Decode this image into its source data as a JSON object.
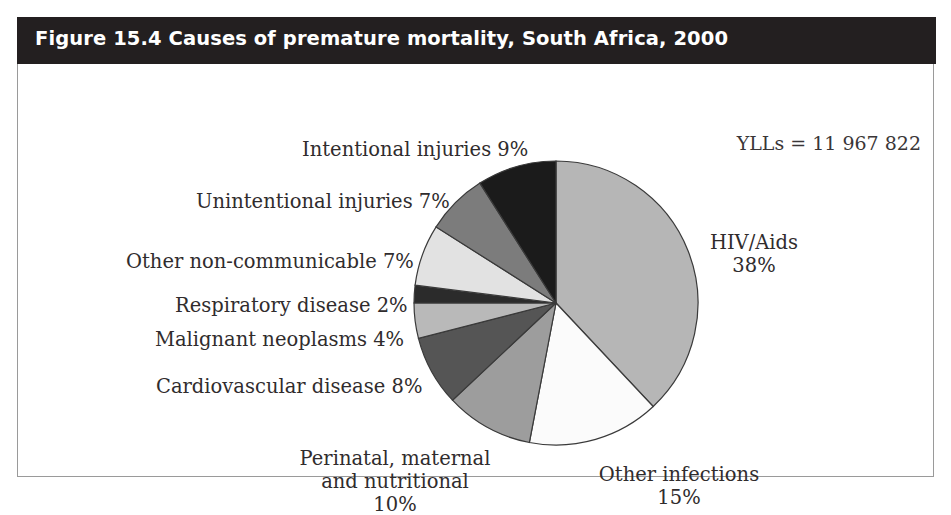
{
  "figure": {
    "title": "Figure 15.4 Causes of premature mortality, South Africa, 2000",
    "yll_total": "YLLs = 11 967 822"
  },
  "labels": {
    "intentional": "Intentional injuries 9%",
    "unintentional": "Unintentional injuries 7%",
    "other_noncommunicable": "Other non-communicable 7%",
    "respiratory": "Respiratory disease 2%",
    "malignant": "Malignant neoplasms 4%",
    "cardiovascular": "Cardiovascular disease 8%",
    "perinatal_line1": "Perinatal, maternal",
    "perinatal_line2": "and nutritional",
    "perinatal_line3": "10%",
    "other_infections_line1": "Other infections",
    "other_infections_line2": "15%",
    "hiv_line1": "HIV/Aids",
    "hiv_line2": "38%"
  },
  "chart_data": {
    "type": "pie",
    "title": "Figure 15.4 Causes of premature mortality, South Africa, 2000",
    "annotation": "YLLs = 11 967 822",
    "total_yll": 11967822,
    "units": "percent of years of life lost (YLLs)",
    "start_angle_deg": 0,
    "direction": "clockwise",
    "legend": "none (direct labels)",
    "categories": [
      "HIV/Aids",
      "Other infections",
      "Perinatal, maternal and nutritional",
      "Cardiovascular disease",
      "Malignant neoplasms",
      "Respiratory disease",
      "Other non-communicable",
      "Unintentional injuries",
      "Intentional injuries"
    ],
    "values": [
      38,
      15,
      10,
      8,
      4,
      2,
      7,
      7,
      9
    ],
    "value_labels": [
      "38%",
      "15%",
      "10%",
      "8%",
      "4%",
      "2%",
      "7%",
      "7%",
      "9%"
    ],
    "colors": [
      "#b6b6b6",
      "#fbfbfb",
      "#9d9d9d",
      "#555555",
      "#b9b9b9",
      "#2b2b2b",
      "#e2e2e2",
      "#7c7c7c",
      "#1b1b1b"
    ],
    "slice_outline": "#3a3a3a"
  },
  "colors": {
    "header_background": "#231f20",
    "header_text": "#ffffff",
    "panel_background": "#ffffff",
    "panel_border": "#9a9a9a",
    "label_text": "#302c2d"
  }
}
